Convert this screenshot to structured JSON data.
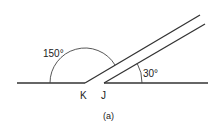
{
  "figure": {
    "caption": "(a)",
    "angles": [
      {
        "label": "150°",
        "vertex": "K",
        "value_deg": 150
      },
      {
        "label": "30°",
        "vertex": "J",
        "value_deg": 30
      }
    ],
    "points": [
      {
        "label": "K"
      },
      {
        "label": "J"
      }
    ],
    "colors": {
      "stroke": "#333333",
      "background": "#ffffff"
    }
  }
}
